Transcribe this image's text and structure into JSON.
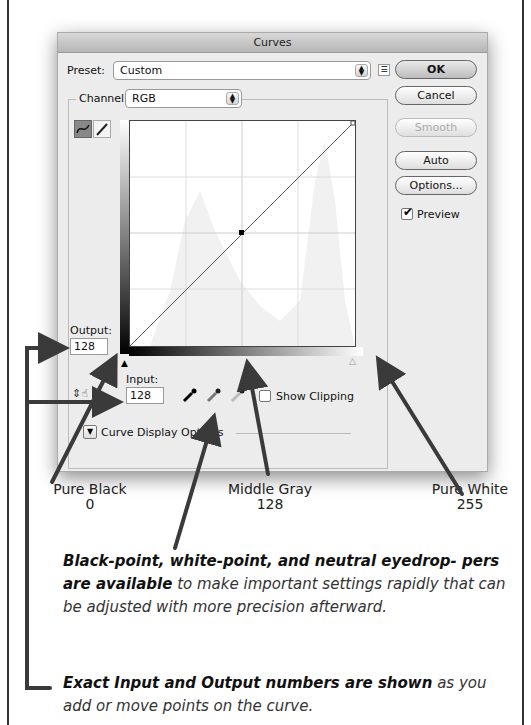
{
  "dialog": {
    "title": "Curves",
    "preset_label": "Preset:",
    "preset_value": "Custom",
    "channel_label": "Channel:",
    "channel_value": "RGB",
    "buttons": {
      "ok": "OK",
      "cancel": "Cancel",
      "smooth": "Smooth",
      "auto": "Auto",
      "options": "Options..."
    },
    "preview_label": "Preview",
    "preview_checked": true,
    "output_label": "Output:",
    "output_value": "128",
    "input_label": "Input:",
    "input_value": "128",
    "show_clipping_label": "Show Clipping",
    "curve_display_options_label": "Curve Display Options",
    "icons": {
      "curve_tool": "curve-point-tool-icon",
      "pencil_tool": "pencil-tool-icon",
      "preset_menu": "preset-options-menu-icon",
      "black_eyedropper": "black-point-eyedropper-icon",
      "gray_eyedropper": "gray-point-eyedropper-icon",
      "white_eyedropper": "white-point-eyedropper-icon",
      "hand_adjust": "on-image-adjust-icon"
    }
  },
  "callouts": {
    "pure_black": {
      "title": "Pure Black",
      "value": "0"
    },
    "middle_gray": {
      "title": "Middle Gray",
      "value": "128"
    },
    "pure_white": {
      "title": "Pure White",
      "value": "255"
    }
  },
  "notes": {
    "eyedroppers_bold": "Black-point, white-point, and neutral eyedrop- pers are available",
    "eyedroppers_rest": " to make important settings rapidly that can be adjusted with more precision afterward.",
    "numbers_bold": "Exact Input and Output numbers are shown",
    "numbers_rest": " as you add or move points on the curve."
  },
  "colors": {
    "arrow": "#3a3a3a",
    "dialog_bg": "#ececec"
  }
}
